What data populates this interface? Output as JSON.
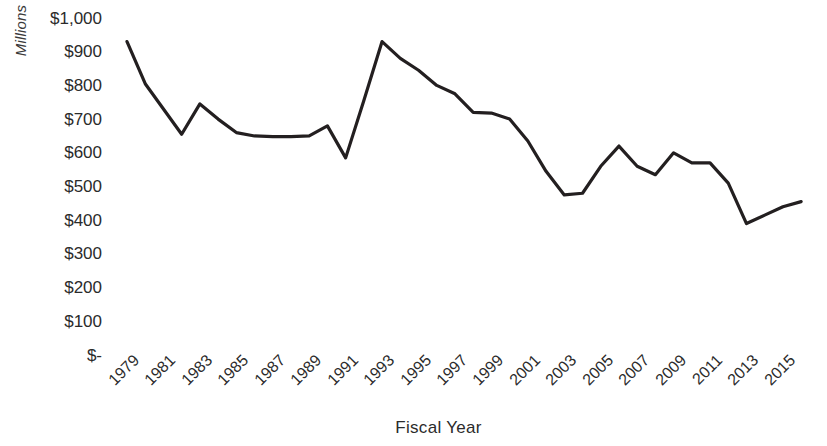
{
  "chart_data": {
    "type": "line",
    "title": "",
    "xlabel": "Fiscal Year",
    "ylabel": "Millions",
    "grid": false,
    "legend": false,
    "xlim": [
      1979,
      1981
    ],
    "ylim": [
      0,
      1000
    ],
    "y_ticks": [
      0,
      100,
      200,
      300,
      400,
      500,
      600,
      700,
      800,
      900,
      1000
    ],
    "y_tick_labels": [
      "$-",
      "$100",
      "$200",
      "$300",
      "$400",
      "$500",
      "$600",
      "$700",
      "$800",
      "$900",
      "$1,000"
    ],
    "x_tick_labels": [
      "1979",
      "1981",
      "1983",
      "1985",
      "1987",
      "1989",
      "1991",
      "1993",
      "1995",
      "1997",
      "1999",
      "2001",
      "2003",
      "2005",
      "2007",
      "2009",
      "2011",
      "2013",
      "2015"
    ],
    "x_tick_years": [
      1979,
      1981,
      1983,
      1985,
      1987,
      1989,
      1991,
      1993,
      1995,
      1997,
      1999,
      2001,
      2003,
      2005,
      2007,
      2009,
      2011,
      2013,
      2015
    ],
    "series": [
      {
        "name": "Fiscal Year Amount",
        "color": "#231f20",
        "x": [
          1979,
          1980,
          1981,
          1982,
          1983,
          1984,
          1985,
          1986,
          1987,
          1988,
          1989,
          1990,
          1991,
          1992,
          1993,
          1994,
          1995,
          1996,
          1997,
          1998,
          1999,
          2000,
          2001,
          2002,
          2003,
          2004,
          2005,
          2006,
          2007,
          2008,
          2009,
          2010,
          2011,
          2012,
          2013,
          2014,
          2015,
          2016
        ],
        "values": [
          930,
          805,
          730,
          655,
          745,
          700,
          660,
          650,
          648,
          648,
          650,
          680,
          585,
          755,
          930,
          880,
          845,
          800,
          775,
          720,
          718,
          700,
          635,
          545,
          475,
          480,
          560,
          620,
          560,
          535,
          600,
          570,
          570,
          510,
          390,
          415,
          440,
          455
        ]
      }
    ],
    "note_clipped_right": true
  },
  "axes": {
    "y_title": "Millions",
    "x_title": "Fiscal Year"
  }
}
